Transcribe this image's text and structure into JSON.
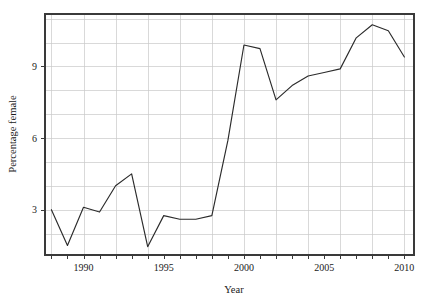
{
  "chart_data": {
    "type": "line",
    "title": "",
    "xlabel": "Year",
    "ylabel": "Percentage female",
    "xlim": [
      1987.6,
      2010.6
    ],
    "ylim": [
      1.1,
      11.2
    ],
    "grid": true,
    "legend": null,
    "x_ticks": [
      1990,
      1995,
      2000,
      2005,
      2010
    ],
    "x_tick_labels": [
      "1990",
      "1995",
      "2000",
      "2005",
      "2010"
    ],
    "x_minor_ticks": [
      1988,
      1989,
      1991,
      1992,
      1993,
      1994,
      1996,
      1997,
      1998,
      1999,
      2001,
      2002,
      2003,
      2004,
      2006,
      2007,
      2008,
      2009
    ],
    "y_ticks": [
      3,
      6,
      9
    ],
    "y_tick_labels": [
      "3",
      "6",
      "9"
    ],
    "y_gridlines": [
      2,
      3,
      4,
      5,
      6,
      7,
      8,
      9,
      10,
      11
    ],
    "x_gridlines": [
      1988,
      1990,
      1992,
      1994,
      1996,
      1998,
      2000,
      2002,
      2004,
      2006,
      2008,
      2010
    ],
    "line_color": "#2b2b2b",
    "grid_color": "#c9c9c9",
    "axis_color": "#3a3a3a",
    "series": [
      {
        "name": "Percentage female",
        "x": [
          1988,
          1989,
          1990,
          1991,
          1992,
          1993,
          1994,
          1995,
          1996,
          1997,
          1998,
          1999,
          2000,
          2001,
          2002,
          2003,
          2004,
          2005,
          2006,
          2007,
          2008,
          2009,
          2010
        ],
        "values": [
          3.0,
          1.5,
          3.1,
          2.9,
          4.0,
          4.5,
          1.45,
          2.75,
          2.6,
          2.6,
          2.75,
          5.9,
          9.9,
          9.75,
          7.6,
          8.2,
          8.6,
          8.75,
          8.9,
          10.2,
          10.75,
          10.5,
          9.4
        ]
      }
    ]
  }
}
